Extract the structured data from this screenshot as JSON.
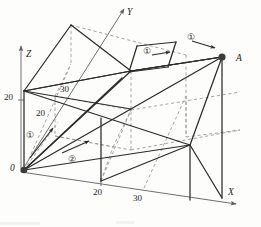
{
  "figure": {
    "kind": "engineering-mechanics-3d-diagram",
    "colors": {
      "background": "#fdfdfb",
      "solid_line": "#2b2b2b",
      "dashed_line": "#9a9a9a",
      "axis_line": "#6f6f6f",
      "text": "#1c1c1c",
      "node_fill": "#3a3a3a"
    }
  },
  "axes": {
    "x_label": "X",
    "y_label": "Y",
    "z_label": "Z",
    "origin_label": "0"
  },
  "points": {
    "origin": "0",
    "a_label": "A"
  },
  "dimensions": [
    {
      "id": "z-tick-20",
      "value": "20"
    },
    {
      "id": "inner-20",
      "value": "20"
    },
    {
      "id": "inner-30",
      "value": "30"
    },
    {
      "id": "x-tick-20",
      "value": "20"
    },
    {
      "id": "x-tick-30",
      "value": "30"
    }
  ],
  "annotations": [
    {
      "id": "force-1-origin",
      "label": "①",
      "direction": "up-right"
    },
    {
      "id": "force-2-base",
      "label": "②",
      "direction": "up-right"
    },
    {
      "id": "force-1-roof",
      "label": "①",
      "direction": "right"
    },
    {
      "id": "force-1-ridge",
      "label": "①",
      "direction": "right"
    }
  ]
}
